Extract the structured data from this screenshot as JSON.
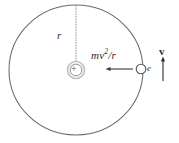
{
  "figure": {
    "background_color": "#ffffff",
    "stroke_color": "#5a5a5a",
    "ink_color": "#2b2b2b"
  },
  "orbit": {
    "name": "electron-orbit-circle",
    "center_x": 76,
    "center_y": 70,
    "radius_x": 67,
    "radius_y": 65,
    "stroke_color": "#6b6b6b",
    "stroke_width": 1
  },
  "nucleus": {
    "label": "+",
    "center_x": 76,
    "center_y": 70,
    "outer_radius": 9,
    "inner_radius": 6,
    "outer_color": "#b9b9b9",
    "inner_color": "#8f8f8f"
  },
  "radius_line": {
    "label": "r",
    "style": "dotted",
    "from_x": 76,
    "from_y": 6,
    "to_x": 76,
    "to_y": 61,
    "color": "#9a9a9a"
  },
  "force_vector": {
    "label_prefix": "mv",
    "label_exponent": "2",
    "label_suffix": "/r",
    "label_full": "mv2/r",
    "direction": "left",
    "tail_x": 133,
    "tip_x": 106,
    "y": 69,
    "color": "#3a3a3a"
  },
  "electron": {
    "label": "e",
    "center_x": 141,
    "center_y": 69,
    "radius": 5,
    "fill": "#ffffff",
    "stroke_color": "#555555"
  },
  "velocity_vector": {
    "label": "v",
    "direction": "up",
    "x": 163,
    "tail_y": 81,
    "tip_y": 57,
    "color": "#2b2b2b"
  }
}
